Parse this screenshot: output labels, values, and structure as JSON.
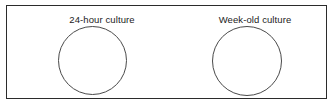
{
  "figure": {
    "background_color": "#ffffff",
    "frame_border_color": "#2b2b2b",
    "dish_stroke_color": "#4a4a4a"
  },
  "panels": [
    {
      "label": "24-hour culture",
      "dish_name": "petri-dish-24-hour",
      "dish_contents": ""
    },
    {
      "label": "Week-old culture",
      "dish_name": "petri-dish-week-old",
      "dish_contents": ""
    }
  ]
}
